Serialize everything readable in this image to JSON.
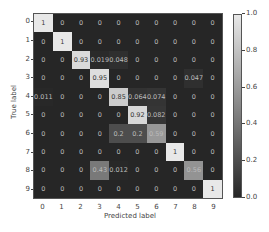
{
  "chart_data": {
    "type": "heatmap",
    "title": "",
    "xlabel": "Predicted label",
    "ylabel": "True label",
    "x_ticks": [
      "0",
      "1",
      "2",
      "3",
      "4",
      "5",
      "6",
      "7",
      "8",
      "9"
    ],
    "y_ticks": [
      "0",
      "1",
      "2",
      "3",
      "4",
      "5",
      "6",
      "7",
      "8",
      "9"
    ],
    "colorbar_ticks": [
      "0.0",
      "0.2",
      "0.4",
      "0.6",
      "0.8",
      "1.0"
    ],
    "colorbar_range": [
      0,
      1
    ],
    "colormap": "gray",
    "matrix_labels": [
      [
        "1",
        "0",
        "0",
        "0",
        "0",
        "0",
        "0",
        "0",
        "0",
        "0"
      ],
      [
        "0",
        "1",
        "0",
        "0",
        "0",
        "0",
        "0",
        "0",
        "0",
        "0"
      ],
      [
        "0",
        "0",
        "0.93",
        "0.019",
        "0.048",
        "0",
        "0",
        "0",
        "0",
        "0"
      ],
      [
        "0",
        "0",
        "0",
        "0.95",
        "0",
        "0",
        "0",
        "0",
        "0.047",
        "0"
      ],
      [
        "0.011",
        "0",
        "0",
        "0",
        "0.85",
        "0.064",
        "0.074",
        "0",
        "0",
        "0"
      ],
      [
        "0",
        "0",
        "0",
        "0",
        "0",
        "0.92",
        "0.082",
        "0",
        "0",
        "0"
      ],
      [
        "0",
        "0",
        "0",
        "0",
        "0.2",
        "0.2",
        "0.59",
        "0",
        "0",
        "0"
      ],
      [
        "0",
        "0",
        "0",
        "0",
        "0",
        "0",
        "0",
        "1",
        "0",
        "0"
      ],
      [
        "0",
        "0",
        "0",
        "0.43",
        "0.012",
        "0",
        "0",
        "0",
        "0.56",
        "0"
      ],
      [
        "0",
        "0",
        "0",
        "0",
        "0",
        "0",
        "0",
        "0",
        "0",
        "1"
      ]
    ],
    "matrix": [
      [
        1,
        0,
        0,
        0,
        0,
        0,
        0,
        0,
        0,
        0
      ],
      [
        0,
        1,
        0,
        0,
        0,
        0,
        0,
        0,
        0,
        0
      ],
      [
        0,
        0,
        0.93,
        0.019,
        0.048,
        0,
        0,
        0,
        0,
        0
      ],
      [
        0,
        0,
        0,
        0.95,
        0,
        0,
        0,
        0,
        0.047,
        0
      ],
      [
        0.011,
        0,
        0,
        0,
        0.85,
        0.064,
        0.074,
        0,
        0,
        0
      ],
      [
        0,
        0,
        0,
        0,
        0,
        0.92,
        0.082,
        0,
        0,
        0
      ],
      [
        0,
        0,
        0,
        0,
        0.2,
        0.2,
        0.59,
        0,
        0,
        0
      ],
      [
        0,
        0,
        0,
        0,
        0,
        0,
        0,
        1,
        0,
        0
      ],
      [
        0,
        0,
        0,
        0.43,
        0.012,
        0,
        0,
        0,
        0.56,
        0
      ],
      [
        0,
        0,
        0,
        0,
        0,
        0,
        0,
        0,
        0,
        1
      ]
    ],
    "grid": false,
    "legend_position": "right (colorbar)"
  }
}
